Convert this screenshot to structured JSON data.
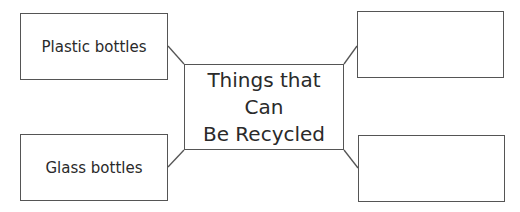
{
  "diagram": {
    "type": "concept-map",
    "center": {
      "line1": "Things that Can",
      "line2": "Be Recycled"
    },
    "branches": [
      {
        "position": "top-left",
        "label": "Plastic bottles"
      },
      {
        "position": "top-right",
        "label": ""
      },
      {
        "position": "bottom-left",
        "label": "Glass bottles"
      },
      {
        "position": "bottom-right",
        "label": ""
      }
    ],
    "colors": {
      "border": "#555555",
      "text": "#2a2a2a",
      "background": "#ffffff"
    }
  }
}
